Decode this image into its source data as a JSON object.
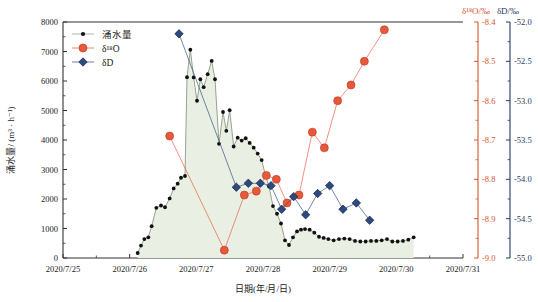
{
  "chart_data": {
    "type": "line",
    "title": "",
    "xlabel": "日期(年/月/日)",
    "ylabel": "涌水量/ (m³ · h⁻¹)",
    "grid": false,
    "legend_position": "top-left",
    "x_tick_labels": [
      "2020/7/25",
      "2020/7/26",
      "2020/7/27",
      "2020/7/28",
      "2020/7/29",
      "2020/7/30",
      "2020/7/31"
    ],
    "x_range_days": [
      0,
      6
    ],
    "axes": [
      {
        "id": "left",
        "label": "涌水量/ (m³ · h⁻¹)",
        "color": "#1a1a1a",
        "ticks": [
          "0",
          "1000",
          "2000",
          "3000",
          "4000",
          "5000",
          "6000",
          "7000",
          "8000"
        ],
        "range": [
          0,
          8000
        ]
      },
      {
        "id": "right1",
        "label": "δ¹⁸O/‰",
        "color": "#d4552e",
        "ticks": [
          "-9.0",
          "-8.9",
          "-8.8",
          "-8.7",
          "-8.6",
          "-8.5",
          "-8.4"
        ],
        "range": [
          -9.0,
          -8.4
        ]
      },
      {
        "id": "right2",
        "label": "δD/‰",
        "color": "#1f3a63",
        "ticks": [
          "-55.0",
          "-54.5",
          "-54.0",
          "-53.5",
          "-53.0",
          "-52.5",
          "-52.0"
        ],
        "range": [
          -55.0,
          -52.0
        ]
      }
    ],
    "series": [
      {
        "name": "涌水量",
        "axis": "left",
        "color": "#111111",
        "marker": "circle",
        "fill": "#e9efe2",
        "unit": "m³·h⁻¹",
        "points": [
          {
            "x": 1.12,
            "y": 170
          },
          {
            "x": 1.17,
            "y": 420
          },
          {
            "x": 1.22,
            "y": 640
          },
          {
            "x": 1.28,
            "y": 700
          },
          {
            "x": 1.33,
            "y": 1080
          },
          {
            "x": 1.4,
            "y": 1700
          },
          {
            "x": 1.47,
            "y": 1780
          },
          {
            "x": 1.53,
            "y": 1720
          },
          {
            "x": 1.6,
            "y": 2020
          },
          {
            "x": 1.66,
            "y": 2360
          },
          {
            "x": 1.72,
            "y": 2520
          },
          {
            "x": 1.77,
            "y": 2720
          },
          {
            "x": 1.83,
            "y": 2780
          },
          {
            "x": 1.86,
            "y": 6130
          },
          {
            "x": 1.91,
            "y": 7060
          },
          {
            "x": 1.96,
            "y": 6120
          },
          {
            "x": 2.01,
            "y": 5330
          },
          {
            "x": 2.06,
            "y": 6060
          },
          {
            "x": 2.11,
            "y": 5790
          },
          {
            "x": 2.17,
            "y": 6230
          },
          {
            "x": 2.23,
            "y": 6680
          },
          {
            "x": 2.28,
            "y": 6060
          },
          {
            "x": 2.34,
            "y": 3870
          },
          {
            "x": 2.4,
            "y": 4950
          },
          {
            "x": 2.45,
            "y": 4310
          },
          {
            "x": 2.5,
            "y": 5010
          },
          {
            "x": 2.56,
            "y": 3780
          },
          {
            "x": 2.62,
            "y": 4080
          },
          {
            "x": 2.68,
            "y": 3980
          },
          {
            "x": 2.74,
            "y": 4060
          },
          {
            "x": 2.8,
            "y": 3900
          },
          {
            "x": 2.86,
            "y": 3740
          },
          {
            "x": 2.92,
            "y": 3540
          },
          {
            "x": 2.98,
            "y": 3320
          },
          {
            "x": 3.04,
            "y": 2780
          },
          {
            "x": 3.09,
            "y": 2420
          },
          {
            "x": 3.15,
            "y": 1760
          },
          {
            "x": 3.21,
            "y": 1500
          },
          {
            "x": 3.27,
            "y": 1170
          },
          {
            "x": 3.33,
            "y": 600
          },
          {
            "x": 3.39,
            "y": 440
          },
          {
            "x": 3.45,
            "y": 700
          },
          {
            "x": 3.51,
            "y": 900
          },
          {
            "x": 3.57,
            "y": 960
          },
          {
            "x": 3.63,
            "y": 980
          },
          {
            "x": 3.7,
            "y": 960
          },
          {
            "x": 3.77,
            "y": 860
          },
          {
            "x": 3.84,
            "y": 720
          },
          {
            "x": 3.91,
            "y": 680
          },
          {
            "x": 3.98,
            "y": 640
          },
          {
            "x": 4.06,
            "y": 600
          },
          {
            "x": 4.14,
            "y": 640
          },
          {
            "x": 4.22,
            "y": 660
          },
          {
            "x": 4.3,
            "y": 640
          },
          {
            "x": 4.38,
            "y": 580
          },
          {
            "x": 4.46,
            "y": 560
          },
          {
            "x": 4.54,
            "y": 560
          },
          {
            "x": 4.62,
            "y": 580
          },
          {
            "x": 4.7,
            "y": 580
          },
          {
            "x": 4.78,
            "y": 600
          },
          {
            "x": 4.86,
            "y": 640
          },
          {
            "x": 4.94,
            "y": 560
          },
          {
            "x": 5.02,
            "y": 560
          },
          {
            "x": 5.1,
            "y": 580
          },
          {
            "x": 5.18,
            "y": 620
          },
          {
            "x": 5.26,
            "y": 700
          }
        ]
      },
      {
        "name": "δ¹⁸O",
        "axis": "right1",
        "color": "#e8583a",
        "marker": "circle",
        "unit": "‰",
        "points": [
          {
            "x": 1.6,
            "y": -8.69
          },
          {
            "x": 2.42,
            "y": -8.98
          },
          {
            "x": 2.72,
            "y": -8.84
          },
          {
            "x": 2.9,
            "y": -8.83
          },
          {
            "x": 3.05,
            "y": -8.79
          },
          {
            "x": 3.2,
            "y": -8.8
          },
          {
            "x": 3.36,
            "y": -8.86
          },
          {
            "x": 3.54,
            "y": -8.84
          },
          {
            "x": 3.74,
            "y": -8.68
          },
          {
            "x": 3.92,
            "y": -8.72
          },
          {
            "x": 4.12,
            "y": -8.6
          },
          {
            "x": 4.32,
            "y": -8.56
          },
          {
            "x": 4.52,
            "y": -8.5
          },
          {
            "x": 4.82,
            "y": -8.42
          }
        ]
      },
      {
        "name": "δD",
        "axis": "right2",
        "color": "#2a4a80",
        "marker": "diamond",
        "unit": "‰",
        "points": [
          {
            "x": 1.74,
            "y": -52.15
          },
          {
            "x": 2.6,
            "y": -54.1
          },
          {
            "x": 2.78,
            "y": -54.05
          },
          {
            "x": 2.96,
            "y": -54.05
          },
          {
            "x": 3.12,
            "y": -54.08
          },
          {
            "x": 3.28,
            "y": -54.38
          },
          {
            "x": 3.46,
            "y": -54.22
          },
          {
            "x": 3.64,
            "y": -54.45
          },
          {
            "x": 3.82,
            "y": -54.18
          },
          {
            "x": 4.0,
            "y": -54.08
          },
          {
            "x": 4.2,
            "y": -54.38
          },
          {
            "x": 4.4,
            "y": -54.3
          },
          {
            "x": 4.6,
            "y": -54.52
          }
        ]
      }
    ]
  },
  "legend": {
    "items": [
      {
        "label": "涌水量",
        "color": "#111111",
        "marker": "circle"
      },
      {
        "label": "δ¹⁸O",
        "color": "#e8583a",
        "marker": "circle"
      },
      {
        "label": "δD",
        "color": "#2a4a80",
        "marker": "diamond"
      }
    ]
  }
}
